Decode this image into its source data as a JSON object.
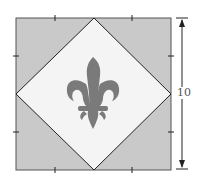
{
  "diagram": {
    "outer_square": {
      "fill": "#c9c9c9",
      "stroke": "#444444"
    },
    "inner_diamond": {
      "fill": "#f4f4f4",
      "stroke": "#222222"
    },
    "emblem": {
      "icon": "fleur-de-lis",
      "color": "#7a7a7a"
    },
    "tick_marks_per_side": 2,
    "dimension": {
      "label": "10",
      "orientation": "vertical"
    }
  }
}
